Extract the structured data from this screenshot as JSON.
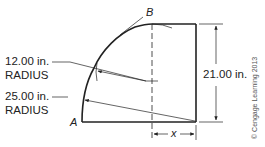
{
  "diagram": {
    "labels": {
      "point_a": "A",
      "point_b": "B",
      "radius_small_value": "12.00 in.",
      "radius_small_word": "RADIUS",
      "radius_large_value": "25.00 in.",
      "radius_large_word": "RADIUS",
      "height_dimension": "21.00 in.",
      "unknown_width": "x",
      "copyright": "© Cengage Learning 2013"
    },
    "colors": {
      "line": "#222222",
      "background": "#ffffff"
    }
  }
}
